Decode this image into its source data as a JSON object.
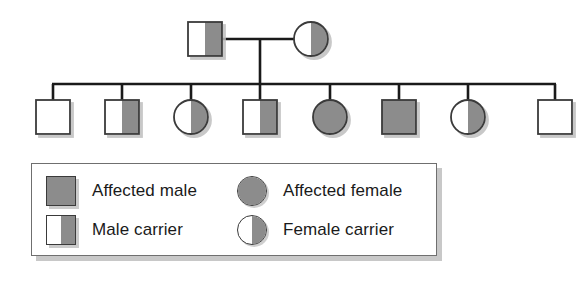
{
  "diagram": {
    "type": "pedigree-chart",
    "title": "",
    "colors": {
      "shade": "#8c8c8c",
      "unshaded": "#ffffff",
      "outline": "#3a3a3a",
      "line": "#1a1a1a",
      "shadow": "#bebebe",
      "legend_border": "#6f6f6f",
      "background": "#ffffff"
    },
    "generations": [
      {
        "name": "generation-i",
        "label": "parents",
        "members": [
          {
            "id": "father",
            "sex": "male",
            "shape": "square",
            "status": "male-carrier",
            "fill": "half-right",
            "cx": 205,
            "cy": 39
          },
          {
            "id": "mother",
            "sex": "female",
            "shape": "circle",
            "status": "female-carrier",
            "fill": "half-right",
            "cx": 311,
            "cy": 39
          }
        ]
      },
      {
        "name": "generation-ii",
        "label": "children",
        "members": [
          {
            "id": "child-1",
            "sex": "male",
            "shape": "square",
            "status": "unaffected-male",
            "fill": "none",
            "cx": 53,
            "cy": 117
          },
          {
            "id": "child-2",
            "sex": "male",
            "shape": "square",
            "status": "male-carrier",
            "fill": "half-right",
            "cx": 122,
            "cy": 117
          },
          {
            "id": "child-3",
            "sex": "female",
            "shape": "circle",
            "status": "female-carrier",
            "fill": "half-right",
            "cx": 191,
            "cy": 117
          },
          {
            "id": "child-4",
            "sex": "male",
            "shape": "square",
            "status": "male-carrier",
            "fill": "half-right",
            "cx": 260,
            "cy": 117
          },
          {
            "id": "child-5",
            "sex": "female",
            "shape": "circle",
            "status": "affected-female",
            "fill": "full",
            "cx": 330,
            "cy": 117
          },
          {
            "id": "child-6",
            "sex": "male",
            "shape": "square",
            "status": "affected-male",
            "fill": "full",
            "cx": 399,
            "cy": 117
          },
          {
            "id": "child-7",
            "sex": "female",
            "shape": "circle",
            "status": "female-carrier",
            "fill": "half-right",
            "cx": 468,
            "cy": 117
          },
          {
            "id": "child-8",
            "sex": "male",
            "shape": "square",
            "status": "unaffected-male",
            "fill": "none",
            "cx": 555,
            "cy": 117
          }
        ]
      }
    ],
    "connections": {
      "marriage_line": {
        "x1": 222,
        "x2": 294,
        "y": 39
      },
      "descent_line": {
        "x": 260,
        "y1": 39,
        "y2": 84
      },
      "sibship_line": {
        "x1": 53,
        "x2": 555,
        "y": 84
      },
      "drop_lines_y": {
        "from": 84,
        "to": 100
      }
    }
  },
  "legend": {
    "entries": [
      {
        "id": "affected-male",
        "label": "Affected male",
        "shape": "square",
        "fill": "full"
      },
      {
        "id": "affected-female",
        "label": "Affected female",
        "shape": "circle",
        "fill": "full"
      },
      {
        "id": "male-carrier",
        "label": "Male carrier",
        "shape": "square",
        "fill": "half-right"
      },
      {
        "id": "female-carrier",
        "label": "Female carrier",
        "shape": "circle",
        "fill": "half-right"
      }
    ]
  }
}
